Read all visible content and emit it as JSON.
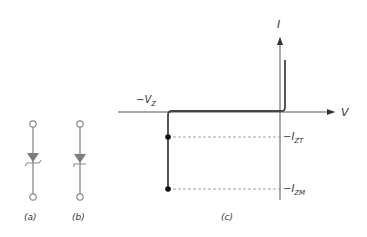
{
  "figure": {
    "panels": [
      {
        "id": "a",
        "label": "(a)",
        "description": "Zener diode symbol, Z-shaped bar"
      },
      {
        "id": "b",
        "label": "(b)",
        "description": "Zener diode symbol, hooked bar"
      },
      {
        "id": "c",
        "label": "(c)",
        "description": "Zener diode I-V characteristic"
      }
    ],
    "axes": {
      "x_label": "V",
      "y_label": "I"
    },
    "annotations": {
      "breakdown_voltage": "−V",
      "breakdown_voltage_sub": "Z",
      "test_current": "−I",
      "test_current_sub": "ZT",
      "max_current": "−I",
      "max_current_sub": "ZM"
    },
    "colors": {
      "symbol": "#8a8a8a",
      "curve": "#444444",
      "axis": "#555555",
      "dashed": "#999999",
      "point": "#111111"
    }
  }
}
